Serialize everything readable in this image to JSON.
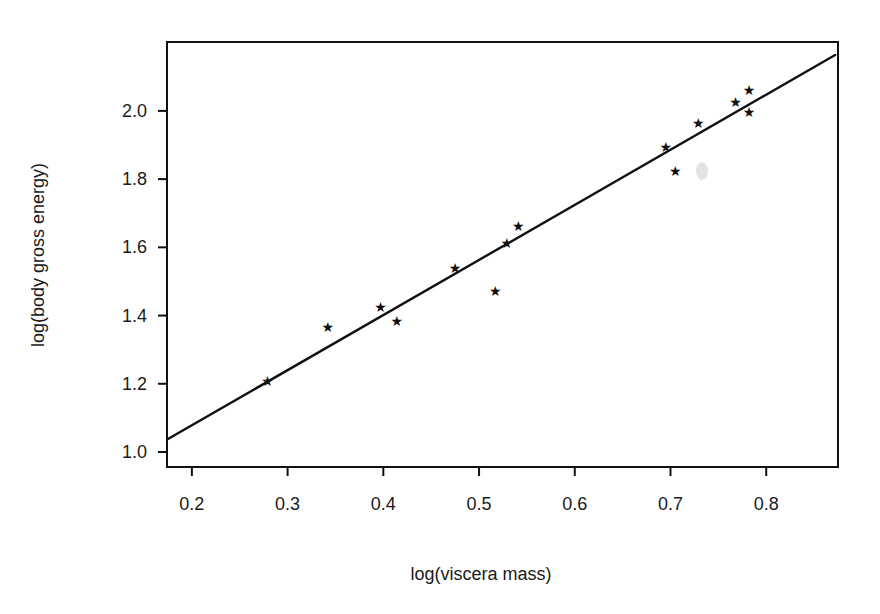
{
  "chart_data": {
    "type": "scatter",
    "title": "",
    "xlabel": "log(viscera mass)",
    "ylabel": "log(body gross energy)",
    "xlim": [
      0.174,
      0.875
    ],
    "ylim": [
      0.956,
      2.202
    ],
    "grid": false,
    "legend": null,
    "x_ticks": [
      0.2,
      0.3,
      0.4,
      0.5,
      0.6,
      0.7,
      0.8
    ],
    "x_tick_labels": [
      "0.2",
      "0.3",
      "0.4",
      "0.5",
      "0.6",
      "0.7",
      "0.8"
    ],
    "y_ticks": [
      1.0,
      1.2,
      1.4,
      1.6,
      1.8,
      2.0
    ],
    "y_tick_labels": [
      "1.0",
      "1.2",
      "1.4",
      "1.6",
      "1.8",
      "2.0"
    ],
    "marker": "*",
    "series": [
      {
        "name": "observations",
        "type": "scatter",
        "points": [
          {
            "x": 0.279,
            "y": 1.208
          },
          {
            "x": 0.342,
            "y": 1.367
          },
          {
            "x": 0.397,
            "y": 1.425
          },
          {
            "x": 0.414,
            "y": 1.384
          },
          {
            "x": 0.475,
            "y": 1.54
          },
          {
            "x": 0.517,
            "y": 1.472
          },
          {
            "x": 0.529,
            "y": 1.613
          },
          {
            "x": 0.541,
            "y": 1.663
          },
          {
            "x": 0.695,
            "y": 1.894
          },
          {
            "x": 0.705,
            "y": 1.824
          },
          {
            "x": 0.729,
            "y": 1.965
          },
          {
            "x": 0.768,
            "y": 2.026
          },
          {
            "x": 0.782,
            "y": 2.062
          },
          {
            "x": 0.782,
            "y": 1.997
          }
        ]
      },
      {
        "name": "fitted regression line",
        "type": "line",
        "points": [
          {
            "x": 0.175,
            "y": 1.038
          },
          {
            "x": 0.872,
            "y": 2.164
          }
        ]
      }
    ]
  },
  "colors": {
    "ink": "#111111",
    "background": "#ffffff"
  }
}
